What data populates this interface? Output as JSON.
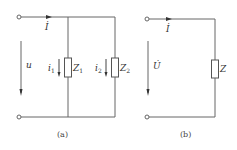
{
  "diagram_a": {
    "caption": "(a)",
    "current_label": "İ",
    "voltage_label": "u",
    "branch1": {
      "current": "i",
      "current_sub": "1",
      "impedance": "Z",
      "impedance_sub": "1"
    },
    "branch2": {
      "current": "i",
      "current_sub": "2",
      "impedance": "Z",
      "impedance_sub": "2"
    }
  },
  "diagram_b": {
    "caption": "(b)",
    "current_label": "İ",
    "voltage_label": "U̇",
    "impedance": "Z"
  },
  "colors": {
    "wire": "#555555",
    "text": "#333333"
  }
}
